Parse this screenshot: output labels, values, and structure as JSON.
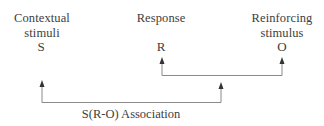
{
  "nodes": {
    "stimulus": {
      "label_line1": "Contextual",
      "label_line2": "stimuli",
      "symbol": "S"
    },
    "response": {
      "label_line1": "Response",
      "symbol": "R"
    },
    "outcome": {
      "label_line1": "Reinforcing",
      "label_line2": "stimulus",
      "symbol": "O"
    }
  },
  "connections": {
    "inner": {
      "from": "R",
      "to": "O",
      "description": "R-O link"
    },
    "outer": {
      "from": "S",
      "to": "R-O link",
      "label": "S(R-O) Association"
    }
  },
  "colors": {
    "text": "#3d3d3d",
    "line": "#8a8a8a",
    "arrowhead": "#333333"
  }
}
